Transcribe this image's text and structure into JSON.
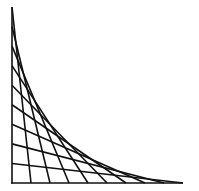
{
  "diagram": {
    "type": "string-art-envelope",
    "colors": {
      "background": "#ffffff",
      "stroke": "#111111"
    },
    "origin": [
      12,
      183
    ],
    "axis_vertical_top": 7,
    "axis_horizontal_end": 183,
    "divisions": 9,
    "line_count": 9,
    "stroke_width": 1.6
  }
}
